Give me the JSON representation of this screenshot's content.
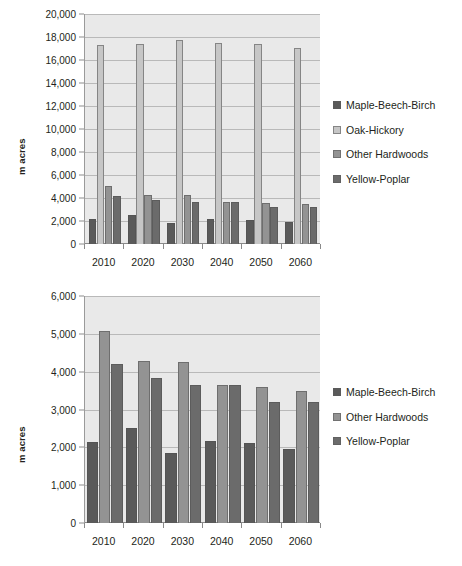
{
  "chart_data": [
    {
      "id": "top",
      "type": "bar",
      "title": "",
      "xlabel": "",
      "ylabel": "m acres",
      "categories": [
        "2010",
        "2020",
        "2030",
        "2040",
        "2050",
        "2060"
      ],
      "ylim": [
        0,
        20000
      ],
      "yticks": [
        0,
        2000,
        4000,
        6000,
        8000,
        10000,
        12000,
        14000,
        16000,
        18000,
        20000
      ],
      "ytick_labels": [
        "0",
        "2,000",
        "4,000",
        "6,000",
        "8,000",
        "10,000",
        "12,000",
        "14,000",
        "16,000",
        "18,000",
        "20,000"
      ],
      "grid": true,
      "legend_position": "right",
      "series": [
        {
          "name": "Maple-Beech-Birch",
          "color": "#5a5a5a",
          "values": [
            2150,
            2520,
            1840,
            2160,
            2120,
            1950
          ]
        },
        {
          "name": "Oak-Hickory",
          "color": "#c6c6c6",
          "values": [
            17320,
            17350,
            17780,
            17500,
            17400,
            17080
          ]
        },
        {
          "name": "Other Hardwoods",
          "color": "#939393",
          "values": [
            5080,
            4280,
            4260,
            3640,
            3600,
            3490
          ]
        },
        {
          "name": "Yellow-Poplar",
          "color": "#6b6b6b",
          "values": [
            4200,
            3820,
            3640,
            3640,
            3210,
            3190
          ]
        }
      ]
    },
    {
      "id": "bottom",
      "type": "bar",
      "title": "",
      "xlabel": "",
      "ylabel": "m acres",
      "categories": [
        "2010",
        "2020",
        "2030",
        "2040",
        "2050",
        "2060"
      ],
      "ylim": [
        0,
        6000
      ],
      "yticks": [
        0,
        1000,
        2000,
        3000,
        4000,
        5000,
        6000
      ],
      "ytick_labels": [
        "0",
        "1,000",
        "2,000",
        "3,000",
        "4,000",
        "5,000",
        "6,000"
      ],
      "grid": true,
      "legend_position": "right",
      "series": [
        {
          "name": "Maple-Beech-Birch",
          "color": "#5a5a5a",
          "values": [
            2150,
            2520,
            1840,
            2160,
            2120,
            1950
          ]
        },
        {
          "name": "Other Hardwoods",
          "color": "#939393",
          "values": [
            5080,
            4280,
            4260,
            3640,
            3600,
            3490
          ]
        },
        {
          "name": "Yellow-Poplar",
          "color": "#6b6b6b",
          "values": [
            4200,
            3820,
            3640,
            3640,
            3210,
            3190
          ]
        }
      ]
    }
  ]
}
